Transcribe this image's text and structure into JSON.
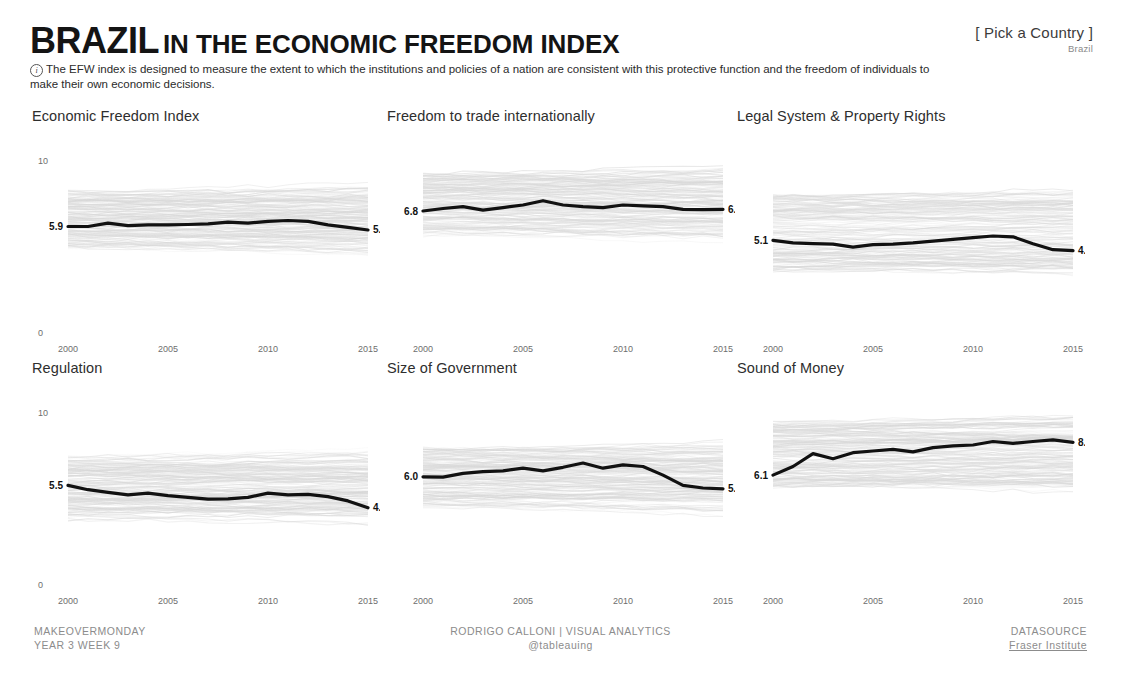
{
  "header": {
    "title_country": "BRAZIL",
    "title_rest": "IN THE ECONOMIC FREEDOM INDEX",
    "info_icon": "info-icon",
    "subtitle": "The EFW index is designed to measure the extent to which the institutions and policies of a nation are consistent with this protective function and the freedom of individuals to make their own economic decisions.",
    "picker_label": "[ Pick a Country ]",
    "picker_value": "Brazil"
  },
  "axis": {
    "y_top": "10",
    "y_bottom": "0",
    "x_ticks": [
      "2000",
      "2005",
      "2010",
      "2015"
    ]
  },
  "footer": {
    "left_line1": "MAKEOVERMONDAY",
    "left_line2": "YEAR 3 WEEK 9",
    "center_line1": "RODRIGO CALLONI | VISUAL ANALYTICS",
    "center_line2": "@tableauing",
    "right_line1": "DATASOURCE",
    "right_line2": "Fraser Institute"
  },
  "colors": {
    "highlight_line": "#111111",
    "background_lines": "#d8d8d8",
    "text": "#2e2e2e",
    "muted": "#8c8c8c"
  },
  "chart_data": [
    {
      "type": "line",
      "title": "Economic Freedom Index",
      "xlabel": "",
      "ylabel": "",
      "ylim": [
        0,
        10
      ],
      "xlim": [
        2000,
        2015
      ],
      "grid": false,
      "legend": "none",
      "start_label": "5.9",
      "end_label": "5.7",
      "x": [
        2000,
        2001,
        2002,
        2003,
        2004,
        2005,
        2006,
        2007,
        2008,
        2009,
        2010,
        2011,
        2012,
        2013,
        2014,
        2015
      ],
      "values": [
        5.9,
        5.9,
        6.1,
        5.95,
        6.0,
        6.0,
        6.02,
        6.05,
        6.15,
        6.1,
        6.2,
        6.25,
        6.2,
        6.0,
        5.85,
        5.7
      ],
      "band": {
        "low": 5.6,
        "high": 7.4,
        "note": "grey background lines of all countries"
      }
    },
    {
      "type": "line",
      "title": "Freedom to trade internationally",
      "xlabel": "",
      "ylabel": "",
      "ylim": [
        0,
        10
      ],
      "xlim": [
        2000,
        2015
      ],
      "grid": false,
      "legend": "none",
      "start_label": "6.8",
      "end_label": "6.9",
      "x": [
        2000,
        2001,
        2002,
        2003,
        2004,
        2005,
        2006,
        2007,
        2008,
        2009,
        2010,
        2011,
        2012,
        2013,
        2014,
        2015
      ],
      "values": [
        6.8,
        6.95,
        7.05,
        6.85,
        7.0,
        7.15,
        7.4,
        7.15,
        7.05,
        7.0,
        7.15,
        7.1,
        7.05,
        6.9,
        6.88,
        6.9
      ],
      "band": {
        "low": 6.2,
        "high": 8.4,
        "note": "grey background lines of all countries"
      }
    },
    {
      "type": "line",
      "title": "Legal System & Property Rights",
      "xlabel": "",
      "ylabel": "",
      "ylim": [
        0,
        10
      ],
      "xlim": [
        2000,
        2015
      ],
      "grid": false,
      "legend": "none",
      "start_label": "5.1",
      "end_label": "4.5",
      "x": [
        2000,
        2001,
        2002,
        2003,
        2004,
        2005,
        2006,
        2007,
        2008,
        2009,
        2010,
        2011,
        2012,
        2013,
        2014,
        2015
      ],
      "values": [
        5.1,
        4.95,
        4.9,
        4.88,
        4.7,
        4.85,
        4.88,
        4.95,
        5.05,
        5.15,
        5.25,
        5.35,
        5.3,
        4.9,
        4.55,
        4.5
      ],
      "band": {
        "low": 4.2,
        "high": 7.2,
        "note": "grey background lines of all countries"
      }
    },
    {
      "type": "line",
      "title": "Regulation",
      "xlabel": "",
      "ylabel": "",
      "ylim": [
        0,
        10
      ],
      "xlim": [
        2000,
        2015
      ],
      "grid": false,
      "legend": "none",
      "start_label": "5.5",
      "end_label": "4.2",
      "x": [
        2000,
        2001,
        2002,
        2003,
        2004,
        2005,
        2006,
        2007,
        2008,
        2009,
        2010,
        2011,
        2012,
        2013,
        2014,
        2015
      ],
      "values": [
        5.5,
        5.25,
        5.1,
        4.95,
        5.05,
        4.9,
        4.8,
        4.7,
        4.72,
        4.8,
        5.05,
        4.95,
        4.98,
        4.85,
        4.6,
        4.2
      ],
      "band": {
        "low": 4.4,
        "high": 6.6,
        "note": "grey background lines of all countries"
      }
    },
    {
      "type": "line",
      "title": "Size of Government",
      "xlabel": "",
      "ylabel": "",
      "ylim": [
        0,
        10
      ],
      "xlim": [
        2000,
        2015
      ],
      "grid": false,
      "legend": "none",
      "start_label": "6.0",
      "end_label": "5.3",
      "x": [
        2000,
        2001,
        2002,
        2003,
        2004,
        2005,
        2006,
        2007,
        2008,
        2009,
        2010,
        2011,
        2012,
        2013,
        2014,
        2015
      ],
      "values": [
        6.0,
        5.98,
        6.2,
        6.3,
        6.35,
        6.5,
        6.35,
        6.55,
        6.8,
        6.5,
        6.7,
        6.6,
        6.1,
        5.5,
        5.35,
        5.3
      ],
      "band": {
        "low": 5.1,
        "high": 7.1,
        "note": "grey background lines of all countries"
      }
    },
    {
      "type": "line",
      "title": "Sound of Money",
      "xlabel": "",
      "ylabel": "",
      "ylim": [
        0,
        10
      ],
      "xlim": [
        2000,
        2015
      ],
      "grid": false,
      "legend": "none",
      "start_label": "6.1",
      "end_label": "8.0",
      "x": [
        2000,
        2001,
        2002,
        2003,
        2004,
        2005,
        2006,
        2007,
        2008,
        2009,
        2010,
        2011,
        2012,
        2013,
        2014,
        2015
      ],
      "values": [
        6.1,
        6.6,
        7.35,
        7.05,
        7.4,
        7.5,
        7.6,
        7.45,
        7.7,
        7.8,
        7.85,
        8.05,
        7.95,
        8.05,
        8.15,
        8.0
      ],
      "band": {
        "low": 6.3,
        "high": 8.6,
        "note": "grey background lines of all countries"
      }
    }
  ]
}
